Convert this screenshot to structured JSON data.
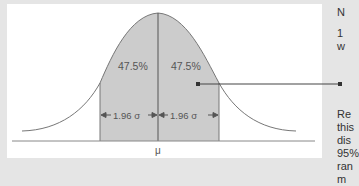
{
  "figure": {
    "left_area_label": "47.5%",
    "right_area_label": "47.5%",
    "left_interval_label": "1.96 σ",
    "right_interval_label": "1.96 σ",
    "mean_label": "μ",
    "colors": {
      "background": "#e5e5e5",
      "panel": "#ffffff",
      "shade": "#cccccc",
      "line": "#666666"
    }
  },
  "side_text": {
    "heading": "N",
    "line1": "1",
    "line2": "w",
    "para": [
      "Re",
      "this",
      "dis",
      "95%",
      "ran",
      "m"
    ]
  }
}
